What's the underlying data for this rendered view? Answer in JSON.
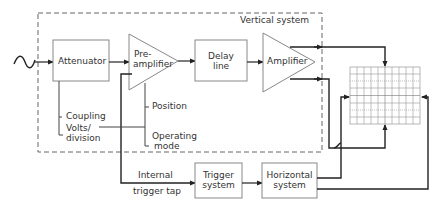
{
  "diagram": {
    "type": "block-diagram",
    "groups": {
      "vertical_system": {
        "label": "Vertical system"
      }
    },
    "blocks": {
      "attenuator": {
        "label": "Attenuator"
      },
      "preamplifier": {
        "line1": "Pre-",
        "line2": "amplifier"
      },
      "delay_line": {
        "line1": "Delay",
        "line2": "line"
      },
      "amplifier": {
        "label": "Amplifier"
      },
      "trigger_system": {
        "line1": "Trigger",
        "line2": "system"
      },
      "horizontal_system": {
        "line1": "Horizontal",
        "line2": "system"
      }
    },
    "controls": {
      "coupling": "Coupling",
      "volts_division_1": "Volts/",
      "volts_division_2": "division",
      "position": "Position",
      "operating_mode_1": "Operating",
      "operating_mode_2": "mode"
    },
    "signals": {
      "internal_trigger_1": "Internal",
      "internal_trigger_2": "trigger tap",
      "input": "~"
    },
    "display": {
      "name": "CRT graticule",
      "columns": 10,
      "rows": 8
    },
    "colors": {
      "line": "#222222",
      "box": "#888888",
      "dash": "#666666"
    }
  }
}
